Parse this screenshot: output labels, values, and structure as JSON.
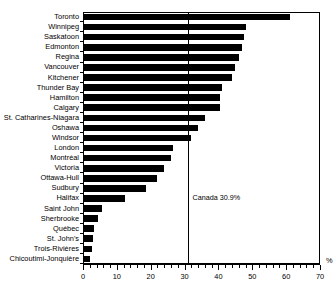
{
  "chart_data": {
    "type": "bar",
    "orientation": "horizontal",
    "title": "",
    "xlabel": "%",
    "ylabel": "",
    "xlim": [
      0,
      70
    ],
    "xticks": [
      0,
      10,
      20,
      30,
      40,
      50,
      60,
      70
    ],
    "xtick_labels": [
      "0",
      "10",
      "20",
      "30",
      "40",
      "50",
      "60",
      "70"
    ],
    "minor_tick_step": 2,
    "grid": false,
    "legend": "none",
    "bar_color": "#000000",
    "categories": [
      "Toronto",
      "Winnipeg",
      "Saskatoon",
      "Edmonton",
      "Regina",
      "Vancouver",
      "Kitchener",
      "Thunder Bay",
      "Hamilton",
      "Calgary",
      "St. Catharines-Niagara",
      "Oshawa",
      "Windsor",
      "London",
      "Montréal",
      "Victoria",
      "Ottawa-Hull",
      "Sudbury",
      "Halifax",
      "Saint John",
      "Sherbrooke",
      "Québec",
      "St. John's",
      "Trois-Rivières",
      "Chicoutimi-Jonquière"
    ],
    "values": [
      61.0,
      48.0,
      47.5,
      47.0,
      46.0,
      45.0,
      44.0,
      41.0,
      40.5,
      40.5,
      36.0,
      34.0,
      32.0,
      26.5,
      26.0,
      24.0,
      22.0,
      18.5,
      12.5,
      5.5,
      4.5,
      3.2,
      3.0,
      2.6,
      2.0
    ],
    "annotations": [
      {
        "name": "canada-reference-line",
        "label": "Canada 30.9%",
        "value": 30.9
      }
    ]
  },
  "figure": {
    "title_fragment": ""
  }
}
